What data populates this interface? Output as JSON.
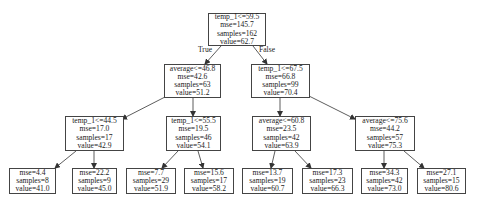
{
  "tree": {
    "type": "regression-decision-tree",
    "edge_labels": {
      "true": "True",
      "false": "False"
    },
    "nodes": [
      {
        "id": "n0",
        "split": "temp_1<=59.5",
        "mse": "mse=145.7",
        "samples": "samples=162",
        "value": "value=62.7",
        "box": [
          208,
          13,
          58,
          33
        ]
      },
      {
        "id": "n1",
        "split": "average<=46.8",
        "mse": "mse=42.6",
        "samples": "samples=63",
        "value": "value=51.2",
        "box": [
          164,
          64,
          57,
          34
        ]
      },
      {
        "id": "n2",
        "split": "temp_1<=67.5",
        "mse": "mse=66.8",
        "samples": "samples=99",
        "value": "value=70.4",
        "box": [
          251,
          64,
          59,
          34
        ]
      },
      {
        "id": "n3",
        "split": "temp_1<=44.5",
        "mse": "mse=17.0",
        "samples": "samples=17",
        "value": "value=42.9",
        "box": [
          65,
          116,
          59,
          35
        ]
      },
      {
        "id": "n4",
        "split": "temp_1<=55.5",
        "mse": "mse=19.5",
        "samples": "samples=46",
        "value": "value=54.1",
        "box": [
          166,
          116,
          55,
          35
        ]
      },
      {
        "id": "n5",
        "split": "average<=60.8",
        "mse": "mse=23.5",
        "samples": "samples=42",
        "value": "value=63.9",
        "box": [
          252,
          116,
          59,
          35
        ]
      },
      {
        "id": "n6",
        "split": "average<=75.6",
        "mse": "mse=44.2",
        "samples": "samples=57",
        "value": "value=75.3",
        "box": [
          355,
          116,
          60,
          35
        ]
      },
      {
        "id": "n7",
        "split": "",
        "mse": "mse=4.4",
        "samples": "samples=8",
        "value": "value=41.0",
        "box": [
          9,
          168,
          47,
          26
        ]
      },
      {
        "id": "n8",
        "split": "",
        "mse": "mse=22.2",
        "samples": "samples=9",
        "value": "value=45.0",
        "box": [
          72,
          168,
          45,
          26
        ]
      },
      {
        "id": "n9",
        "split": "",
        "mse": "mse=7.7",
        "samples": "samples=29",
        "value": "value=51.9",
        "box": [
          126,
          168,
          50,
          26
        ]
      },
      {
        "id": "n10",
        "split": "",
        "mse": "mse=15.6",
        "samples": "samples=17",
        "value": "value=58.2",
        "box": [
          184,
          168,
          50,
          26
        ]
      },
      {
        "id": "n11",
        "split": "",
        "mse": "mse=13.7",
        "samples": "samples=19",
        "value": "value=60.7",
        "box": [
          242,
          168,
          51,
          26
        ]
      },
      {
        "id": "n12",
        "split": "",
        "mse": "mse=17.3",
        "samples": "samples=23",
        "value": "value=66.3",
        "box": [
          302,
          168,
          51,
          26
        ]
      },
      {
        "id": "n13",
        "split": "",
        "mse": "mse=34.3",
        "samples": "samples=42",
        "value": "value=73.0",
        "box": [
          361,
          168,
          47,
          26
        ]
      },
      {
        "id": "n14",
        "split": "",
        "mse": "mse=27.1",
        "samples": "samples=15",
        "value": "value=80.6",
        "box": [
          417,
          168,
          49,
          26
        ]
      }
    ],
    "edges": [
      {
        "from": "n0",
        "to": "n1",
        "x1": 221,
        "y1": 46,
        "x2": 205,
        "y2": 64
      },
      {
        "from": "n0",
        "to": "n2",
        "x1": 253,
        "y1": 46,
        "x2": 267,
        "y2": 64
      },
      {
        "from": "n1",
        "to": "n3",
        "x1": 165,
        "y1": 97,
        "x2": 122,
        "y2": 119
      },
      {
        "from": "n1",
        "to": "n4",
        "x1": 193,
        "y1": 98,
        "x2": 193,
        "y2": 116
      },
      {
        "from": "n2",
        "to": "n5",
        "x1": 280,
        "y1": 98,
        "x2": 280,
        "y2": 116
      },
      {
        "from": "n2",
        "to": "n6",
        "x1": 309,
        "y1": 96,
        "x2": 355,
        "y2": 119
      },
      {
        "from": "n3",
        "to": "n7",
        "x1": 76,
        "y1": 151,
        "x2": 55,
        "y2": 168
      },
      {
        "from": "n3",
        "to": "n8",
        "x1": 94,
        "y1": 151,
        "x2": 94,
        "y2": 168
      },
      {
        "from": "n4",
        "to": "n9",
        "x1": 178,
        "y1": 151,
        "x2": 162,
        "y2": 168
      },
      {
        "from": "n4",
        "to": "n10",
        "x1": 198,
        "y1": 151,
        "x2": 203,
        "y2": 168
      },
      {
        "from": "n5",
        "to": "n11",
        "x1": 275,
        "y1": 151,
        "x2": 271,
        "y2": 168
      },
      {
        "from": "n5",
        "to": "n12",
        "x1": 295,
        "y1": 151,
        "x2": 311,
        "y2": 168
      },
      {
        "from": "n6",
        "to": "n13",
        "x1": 384,
        "y1": 151,
        "x2": 384,
        "y2": 168
      },
      {
        "from": "n6",
        "to": "n14",
        "x1": 404,
        "y1": 151,
        "x2": 424,
        "y2": 168
      }
    ]
  },
  "colors": {
    "border": "#444444",
    "edge": "#333333",
    "text": "#222222",
    "background": "#ffffff"
  }
}
